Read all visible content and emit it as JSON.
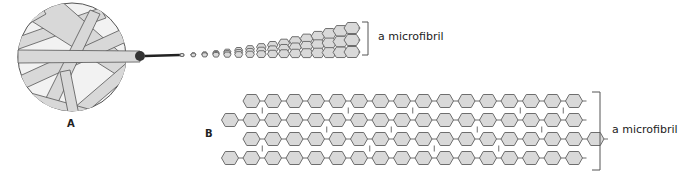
{
  "panels": {
    "A": {
      "letter": "A",
      "bracket_label": "a microfibril",
      "fan_rows": 3
    },
    "B": {
      "letter": "B",
      "bracket_label": "a microfibril",
      "rows": [
        {
          "start_offset": 1,
          "count": 16
        },
        {
          "start_offset": 0,
          "count": 17
        },
        {
          "start_offset": 1,
          "count": 17
        },
        {
          "start_offset": 0,
          "count": 17
        }
      ]
    }
  },
  "colors": {
    "fill": "#d9d9d9",
    "stroke": "#6e6e6e",
    "text": "#222222"
  }
}
